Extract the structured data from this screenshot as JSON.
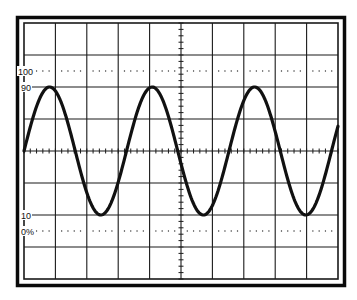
{
  "diagram": {
    "type": "oscilloscope-graticule",
    "title": "",
    "graticule": {
      "divisions_x": 10,
      "divisions_y": 8,
      "minor_ticks_per_division": 5,
      "grid_color": "#1a1a1a",
      "trace_color": "#111111",
      "frame_color": "#0a0a0a",
      "background": "#ffffff"
    },
    "labels": {
      "l100": "100",
      "l90": "90",
      "l10": "10",
      "l0": "0%"
    },
    "reference_lines": [
      {
        "name": "100-percent-line",
        "style": "dotted",
        "level_percent": 100
      },
      {
        "name": "90-percent-line",
        "style": "solid-grid",
        "level_percent": 90
      },
      {
        "name": "10-percent-line",
        "style": "solid-grid",
        "level_percent": 10
      },
      {
        "name": "0-percent-line",
        "style": "dotted",
        "level_percent": 0
      }
    ],
    "waveform": {
      "shape": "sine",
      "cycles_visible": 3.1,
      "peak_level_percent": 90,
      "trough_level_percent": 10,
      "period_divisions": 3.25,
      "start_phase": "rising-zero-crossing-at-left-edge"
    }
  }
}
